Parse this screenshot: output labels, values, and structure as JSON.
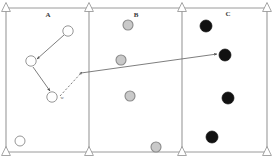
{
  "figure": {
    "kind": "three-panel-state-diagram",
    "background_color": "#ffffff",
    "frame_color": "#9a9a9a",
    "width": 274,
    "height": 161
  },
  "panels": [
    {
      "id": "A",
      "label": "A",
      "label_x": 48,
      "label_y": 17,
      "x_start": 6,
      "x_end": 89,
      "node_style": "open",
      "node_fill_color": "#ffffff",
      "node_stroke_color": "#8a8a8a"
    },
    {
      "id": "B",
      "label": "B",
      "label_x": 136,
      "label_y": 17,
      "x_start": 89,
      "x_end": 182,
      "node_style": "gray",
      "node_fill_color": "#c9c9c9",
      "node_stroke_color": "#8a8a8a"
    },
    {
      "id": "C",
      "label": "C",
      "label_x": 228,
      "label_y": 16,
      "x_start": 182,
      "x_end": 267,
      "node_style": "black",
      "node_fill_color": "#111111",
      "node_stroke_color": "#111111"
    }
  ],
  "frame": {
    "left": 6,
    "right": 267,
    "top": 8,
    "bottom": 152,
    "dividers": [
      89,
      182
    ]
  },
  "supports": [
    {
      "name": "support-top-left",
      "x": 6,
      "y": 8,
      "orientation": "up"
    },
    {
      "name": "support-top-mid1",
      "x": 89,
      "y": 8,
      "orientation": "up"
    },
    {
      "name": "support-top-mid2",
      "x": 182,
      "y": 8,
      "orientation": "up"
    },
    {
      "name": "support-top-right",
      "x": 267,
      "y": 8,
      "orientation": "up"
    },
    {
      "name": "support-bottom-left",
      "x": 6,
      "y": 152,
      "orientation": "up"
    },
    {
      "name": "support-bottom-mid1",
      "x": 89,
      "y": 152,
      "orientation": "up"
    },
    {
      "name": "support-bottom-mid2",
      "x": 182,
      "y": 152,
      "orientation": "up"
    },
    {
      "name": "support-bottom-right",
      "x": 267,
      "y": 152,
      "orientation": "up"
    }
  ],
  "nodes": [
    {
      "name": "node-a1",
      "panel": "A",
      "style": "open",
      "cx": 68,
      "cy": 31,
      "r": 5.2
    },
    {
      "name": "node-a2",
      "panel": "A",
      "style": "open",
      "cx": 31,
      "cy": 61,
      "r": 5.2
    },
    {
      "name": "node-a3",
      "panel": "A",
      "style": "open",
      "cx": 52,
      "cy": 97,
      "r": 5.2,
      "label": "w"
    },
    {
      "name": "node-a4",
      "panel": "A",
      "style": "open",
      "cx": 20,
      "cy": 141,
      "r": 5.0
    },
    {
      "name": "node-b1",
      "panel": "B",
      "style": "gray",
      "cx": 128,
      "cy": 25,
      "r": 5.0
    },
    {
      "name": "node-b2",
      "panel": "B",
      "style": "gray",
      "cx": 121,
      "cy": 60,
      "r": 5.0
    },
    {
      "name": "node-b3",
      "panel": "B",
      "style": "gray",
      "cx": 130,
      "cy": 96,
      "r": 5.0
    },
    {
      "name": "node-b4",
      "panel": "B",
      "style": "gray",
      "cx": 156,
      "cy": 147,
      "r": 5.0
    },
    {
      "name": "node-c1",
      "panel": "C",
      "style": "black",
      "cx": 206,
      "cy": 26,
      "r": 6.0
    },
    {
      "name": "node-c2",
      "panel": "C",
      "style": "black",
      "cx": 225,
      "cy": 55,
      "r": 6.0
    },
    {
      "name": "node-c3",
      "panel": "C",
      "style": "black",
      "cx": 228,
      "cy": 98,
      "r": 6.0
    },
    {
      "name": "node-c4",
      "panel": "C",
      "style": "black",
      "cx": 212,
      "cy": 137,
      "r": 6.0
    }
  ],
  "arrows": [
    {
      "name": "arrow-a1-to-a2",
      "style": "solid",
      "from_x": 64,
      "from_y": 35,
      "to_x": 37,
      "to_y": 59,
      "stroke_color": "#6f6f6f"
    },
    {
      "name": "arrow-a2-to-a3",
      "style": "solid",
      "from_x": 33,
      "from_y": 67,
      "to_x": 50,
      "to_y": 91,
      "stroke_color": "#6f6f6f"
    },
    {
      "name": "arrow-a3-to-junction-dashed",
      "style": "dashed",
      "from_x": 60,
      "from_y": 96,
      "to_x": 82,
      "to_y": 72,
      "stroke_color": "#6f6f6f"
    },
    {
      "name": "arrow-junction-to-c2",
      "style": "solid",
      "from_x": 81,
      "from_y": 73,
      "to_x": 217,
      "to_y": 54,
      "stroke_color": "#6f6f6f"
    }
  ],
  "node_labels": [
    {
      "name": "node-label-w",
      "text": "w",
      "x": 62,
      "y": 99
    }
  ]
}
